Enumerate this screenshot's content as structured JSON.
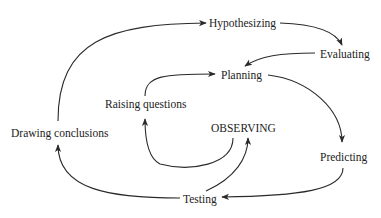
{
  "diagram": {
    "type": "cycle-flow",
    "nodes": [
      {
        "id": "hypothesizing",
        "label": "Hypothesizing"
      },
      {
        "id": "evaluating",
        "label": "Evaluating"
      },
      {
        "id": "planning",
        "label": "Planning"
      },
      {
        "id": "raising_questions",
        "label": "Raising questions"
      },
      {
        "id": "observing",
        "label": "OBSERVING"
      },
      {
        "id": "drawing_conclusions",
        "label": "Drawing conclusions"
      },
      {
        "id": "predicting",
        "label": "Predicting"
      },
      {
        "id": "testing",
        "label": "Testing"
      }
    ],
    "edges": [
      {
        "from": "drawing_conclusions",
        "to": "hypothesizing"
      },
      {
        "from": "hypothesizing",
        "to": "evaluating"
      },
      {
        "from": "evaluating",
        "to": "planning"
      },
      {
        "from": "raising_questions",
        "to": "planning"
      },
      {
        "from": "planning",
        "to": "predicting"
      },
      {
        "from": "predicting",
        "to": "testing"
      },
      {
        "from": "testing",
        "to": "drawing_conclusions"
      },
      {
        "from": "testing",
        "to": "observing"
      },
      {
        "from": "observing",
        "to": "raising_questions"
      }
    ]
  }
}
